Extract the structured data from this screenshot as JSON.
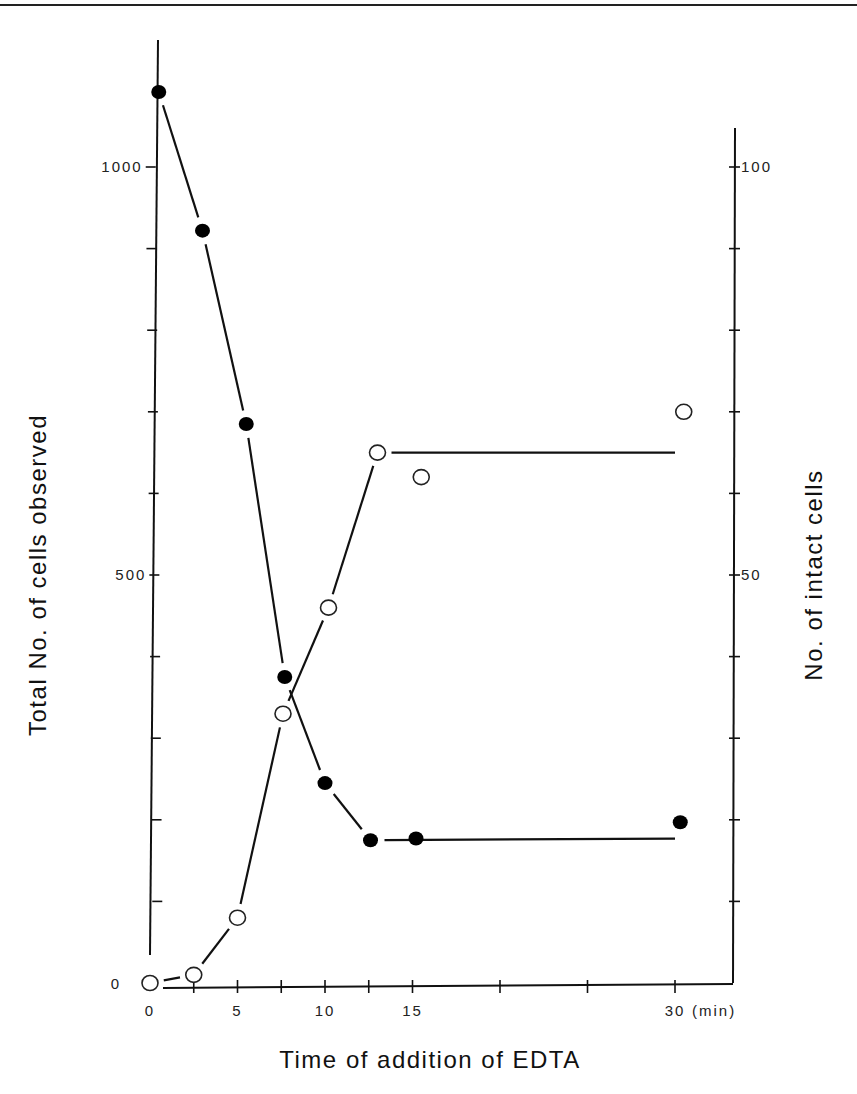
{
  "figure": {
    "left_axis_title": "Total No. of cells observed",
    "right_axis_title": "No. of intact cells",
    "x_axis_title": "Time of addition of EDTA",
    "x_unit_label": "(min)"
  },
  "chart_data": {
    "type": "line",
    "title": "",
    "xlabel": "Time of addition of EDTA (min)",
    "ylabel": "Total No. of cells observed",
    "y2label": "No. of intact cells",
    "xlim": [
      0,
      32
    ],
    "ylim": [
      0,
      1100
    ],
    "y2lim": [
      0,
      110
    ],
    "grid": false,
    "legend": "none",
    "x_ticks": [
      {
        "value": 0,
        "label": "0"
      },
      {
        "value": 2.5,
        "label": ""
      },
      {
        "value": 5,
        "label": "5"
      },
      {
        "value": 7.5,
        "label": ""
      },
      {
        "value": 10,
        "label": "10"
      },
      {
        "value": 12.5,
        "label": ""
      },
      {
        "value": 15,
        "label": "15"
      },
      {
        "value": 20,
        "label": ""
      },
      {
        "value": 25,
        "label": ""
      },
      {
        "value": 30,
        "label": "30"
      }
    ],
    "y_ticks": [
      {
        "value": 0,
        "label": "0"
      },
      {
        "value": 100,
        "label": ""
      },
      {
        "value": 200,
        "label": ""
      },
      {
        "value": 300,
        "label": ""
      },
      {
        "value": 400,
        "label": ""
      },
      {
        "value": 500,
        "label": "500"
      },
      {
        "value": 600,
        "label": ""
      },
      {
        "value": 700,
        "label": ""
      },
      {
        "value": 800,
        "label": ""
      },
      {
        "value": 900,
        "label": ""
      },
      {
        "value": 1000,
        "label": "1000"
      }
    ],
    "y2_ticks": [
      {
        "value": 10,
        "label": ""
      },
      {
        "value": 20,
        "label": ""
      },
      {
        "value": 30,
        "label": ""
      },
      {
        "value": 40,
        "label": ""
      },
      {
        "value": 50,
        "label": "50"
      },
      {
        "value": 60,
        "label": ""
      },
      {
        "value": 70,
        "label": ""
      },
      {
        "value": 80,
        "label": ""
      },
      {
        "value": 90,
        "label": ""
      },
      {
        "value": 100,
        "label": "100"
      }
    ],
    "series": [
      {
        "name": "Total No. of cells observed",
        "marker": "filled-circle",
        "axis": "left",
        "x": [
          0.5,
          3,
          5.5,
          7.7,
          10,
          12.6,
          15.2,
          30.3
        ],
        "values": [
          1092,
          922,
          685,
          375,
          245,
          175,
          177,
          197
        ],
        "fit_line": [
          [
            0.5,
            1092
          ],
          [
            3,
            922
          ],
          [
            5.5,
            685
          ],
          [
            7.7,
            375
          ],
          [
            10,
            245
          ],
          [
            12.6,
            175
          ],
          [
            30,
            177
          ]
        ]
      },
      {
        "name": "No. of intact cells",
        "marker": "open-circle",
        "axis": "right",
        "x": [
          0,
          2.5,
          5,
          7.6,
          10.2,
          13,
          15.5,
          30.5
        ],
        "values": [
          0,
          1,
          8,
          33,
          46,
          65,
          62,
          70
        ],
        "fit_line": [
          [
            0,
            0
          ],
          [
            2.5,
            1
          ],
          [
            5,
            8
          ],
          [
            7.6,
            33
          ],
          [
            10.2,
            46
          ],
          [
            13,
            65
          ],
          [
            30,
            65
          ]
        ]
      }
    ]
  }
}
